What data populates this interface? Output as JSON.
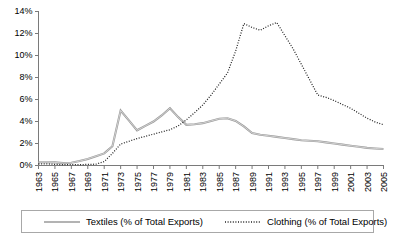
{
  "chart_data": {
    "type": "line",
    "title": "",
    "xlabel": "",
    "ylabel": "",
    "ylim": [
      0,
      14
    ],
    "ytick_values": [
      0,
      2,
      4,
      6,
      8,
      10,
      12,
      14
    ],
    "ytick_labels": [
      "0%",
      "2%",
      "4%",
      "6%",
      "8%",
      "10%",
      "12%",
      "14%"
    ],
    "grid": false,
    "legend_position": "bottom",
    "x": [
      1963,
      1964,
      1965,
      1966,
      1967,
      1968,
      1969,
      1970,
      1971,
      1972,
      1973,
      1974,
      1975,
      1976,
      1977,
      1978,
      1979,
      1980,
      1981,
      1982,
      1983,
      1984,
      1985,
      1986,
      1987,
      1988,
      1989,
      1990,
      1991,
      1992,
      1993,
      1994,
      1995,
      1996,
      1997,
      1998,
      1999,
      2000,
      2001,
      2002,
      2003,
      2004,
      2005
    ],
    "xtick_labels": [
      "1963",
      "1965",
      "1967",
      "1969",
      "1971",
      "1973",
      "1975",
      "1977",
      "1979",
      "1981",
      "1983",
      "1985",
      "1987",
      "1989",
      "1991",
      "1993",
      "1995",
      "1997",
      "1999",
      "2001",
      "2003",
      "2005"
    ],
    "xlim": [
      1963,
      2005
    ],
    "series": [
      {
        "name": "Textiles (% of Total Exports)",
        "style": "solid",
        "color": "#9a9a9a",
        "values": [
          0.3,
          0.3,
          0.28,
          0.22,
          0.25,
          0.4,
          0.6,
          0.85,
          1.1,
          1.75,
          5.0,
          4.1,
          3.2,
          3.6,
          4.0,
          4.55,
          5.2,
          4.4,
          3.7,
          3.75,
          3.85,
          4.05,
          4.25,
          4.3,
          4.05,
          3.55,
          2.95,
          2.8,
          2.7,
          2.6,
          2.5,
          2.4,
          2.3,
          2.25,
          2.2,
          2.1,
          2.0,
          1.9,
          1.8,
          1.7,
          1.6,
          1.55,
          1.5
        ]
      },
      {
        "name": "Clothing (% of Total Exports)",
        "style": "dotted",
        "color": "#222222",
        "values": [
          0.15,
          0.15,
          0.1,
          0.08,
          0.08,
          0.08,
          0.1,
          0.12,
          0.35,
          1.1,
          1.95,
          2.2,
          2.45,
          2.65,
          2.85,
          3.05,
          3.25,
          3.6,
          4.15,
          4.8,
          5.5,
          6.4,
          7.4,
          8.4,
          10.4,
          12.9,
          12.55,
          12.3,
          12.7,
          13.0,
          11.8,
          10.6,
          9.2,
          7.8,
          6.4,
          6.2,
          5.9,
          5.55,
          5.2,
          4.75,
          4.3,
          3.95,
          3.7
        ]
      }
    ]
  },
  "legend": {
    "entries": [
      {
        "label": "Textiles (% of Total Exports)",
        "style": "solid"
      },
      {
        "label": "Clothing (% of Total Exports)",
        "style": "dotted"
      }
    ]
  }
}
